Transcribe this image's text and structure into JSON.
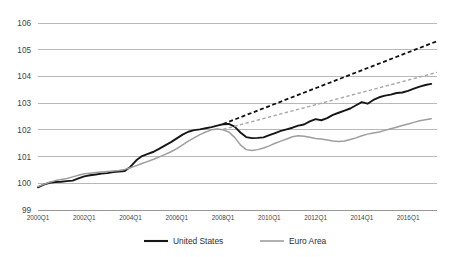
{
  "chart_data": {
    "type": "line",
    "title": "",
    "subtitle": "",
    "xlabel": "",
    "ylabel": "",
    "ylim": [
      99,
      106
    ],
    "xlim": [
      "2000Q1",
      "2017Q1"
    ],
    "grid": true,
    "legend_position": "bottom",
    "y_ticks": [
      "99",
      "100",
      "101",
      "102",
      "103",
      "104",
      "105",
      "106"
    ],
    "y_tick_values": [
      99,
      100,
      101,
      102,
      103,
      104,
      105,
      106
    ],
    "x_ticks": [
      "2000Q1",
      "2002Q1",
      "2004Q1",
      "2006Q1",
      "2008Q1",
      "2010Q1",
      "2012Q1",
      "2014Q1",
      "2016Q1"
    ],
    "x_tick_values": [
      2000.0,
      2002.0,
      2004.0,
      2006.0,
      2008.0,
      2010.0,
      2012.0,
      2014.0,
      2016.0
    ],
    "x_start": 2000.0,
    "x_end": 2017.25,
    "series": [
      {
        "name": "United States",
        "style": "solid",
        "color": "#161616",
        "x": [
          2000.0,
          2000.25,
          2000.5,
          2000.75,
          2001.0,
          2001.25,
          2001.5,
          2001.75,
          2002.0,
          2002.25,
          2002.5,
          2002.75,
          2003.0,
          2003.25,
          2003.5,
          2003.75,
          2004.0,
          2004.25,
          2004.5,
          2004.75,
          2005.0,
          2005.25,
          2005.5,
          2005.75,
          2006.0,
          2006.25,
          2006.5,
          2006.75,
          2007.0,
          2007.25,
          2007.5,
          2007.75,
          2008.0,
          2008.25,
          2008.5,
          2008.75,
          2009.0,
          2009.25,
          2009.5,
          2009.75,
          2010.0,
          2010.25,
          2010.5,
          2010.75,
          2011.0,
          2011.25,
          2011.5,
          2011.75,
          2012.0,
          2012.25,
          2012.5,
          2012.75,
          2013.0,
          2013.25,
          2013.5,
          2013.75,
          2014.0,
          2014.25,
          2014.5,
          2014.75,
          2015.0,
          2015.25,
          2015.5,
          2015.75,
          2016.0,
          2016.25,
          2016.5,
          2016.75,
          2017.0
        ],
        "y": [
          99.85,
          99.95,
          100.02,
          100.05,
          100.06,
          100.08,
          100.1,
          100.18,
          100.26,
          100.3,
          100.33,
          100.36,
          100.38,
          100.42,
          100.44,
          100.46,
          100.62,
          100.86,
          101.02,
          101.1,
          101.18,
          101.3,
          101.42,
          101.54,
          101.68,
          101.82,
          101.93,
          101.99,
          102.02,
          102.06,
          102.1,
          102.16,
          102.21,
          102.22,
          102.12,
          101.9,
          101.73,
          101.69,
          101.7,
          101.72,
          101.8,
          101.88,
          101.96,
          102.02,
          102.08,
          102.16,
          102.2,
          102.32,
          102.4,
          102.36,
          102.44,
          102.56,
          102.64,
          102.72,
          102.8,
          102.92,
          103.04,
          102.98,
          103.12,
          103.22,
          103.28,
          103.32,
          103.38,
          103.4,
          103.46,
          103.54,
          103.62,
          103.68,
          103.72
        ]
      },
      {
        "name": "Euro Area",
        "style": "solid",
        "color": "#9e9e9e",
        "x": [
          2000.0,
          2000.25,
          2000.5,
          2000.75,
          2001.0,
          2001.25,
          2001.5,
          2001.75,
          2002.0,
          2002.25,
          2002.5,
          2002.75,
          2003.0,
          2003.25,
          2003.5,
          2003.75,
          2004.0,
          2004.25,
          2004.5,
          2004.75,
          2005.0,
          2005.25,
          2005.5,
          2005.75,
          2006.0,
          2006.25,
          2006.5,
          2006.75,
          2007.0,
          2007.25,
          2007.5,
          2007.75,
          2008.0,
          2008.25,
          2008.5,
          2008.75,
          2009.0,
          2009.25,
          2009.5,
          2009.75,
          2010.0,
          2010.25,
          2010.5,
          2010.75,
          2011.0,
          2011.25,
          2011.5,
          2011.75,
          2012.0,
          2012.25,
          2012.5,
          2012.75,
          2013.0,
          2013.25,
          2013.5,
          2013.75,
          2014.0,
          2014.25,
          2014.5,
          2014.75,
          2015.0,
          2015.25,
          2015.5,
          2015.75,
          2016.0,
          2016.25,
          2016.5,
          2016.75,
          2017.0
        ],
        "y": [
          99.88,
          99.96,
          100.04,
          100.1,
          100.14,
          100.18,
          100.24,
          100.3,
          100.36,
          100.38,
          100.4,
          100.42,
          100.44,
          100.46,
          100.48,
          100.52,
          100.58,
          100.66,
          100.74,
          100.82,
          100.9,
          100.99,
          101.08,
          101.18,
          101.3,
          101.44,
          101.58,
          101.7,
          101.82,
          101.92,
          102.0,
          102.03,
          102.0,
          101.92,
          101.72,
          101.44,
          101.26,
          101.23,
          101.26,
          101.32,
          101.4,
          101.5,
          101.58,
          101.66,
          101.74,
          101.78,
          101.76,
          101.72,
          101.68,
          101.66,
          101.62,
          101.58,
          101.56,
          101.58,
          101.64,
          101.7,
          101.78,
          101.84,
          101.88,
          101.92,
          101.98,
          102.04,
          102.1,
          102.16,
          102.22,
          102.28,
          102.34,
          102.38,
          102.42
        ]
      },
      {
        "name": "United States trend",
        "style": "dashed",
        "color": "#111111",
        "x": [
          2008.0,
          2017.25
        ],
        "y": [
          102.22,
          105.32
        ]
      },
      {
        "name": "Euro Area trend",
        "style": "dashed",
        "color": "#a8a8a8",
        "x": [
          2008.0,
          2017.25
        ],
        "y": [
          102.02,
          104.15
        ]
      }
    ],
    "legend": [
      {
        "label": "United States",
        "color": "#161616",
        "style": "solid"
      },
      {
        "label": "Euro Area",
        "color": "#9e9e9e",
        "style": "solid"
      }
    ]
  }
}
